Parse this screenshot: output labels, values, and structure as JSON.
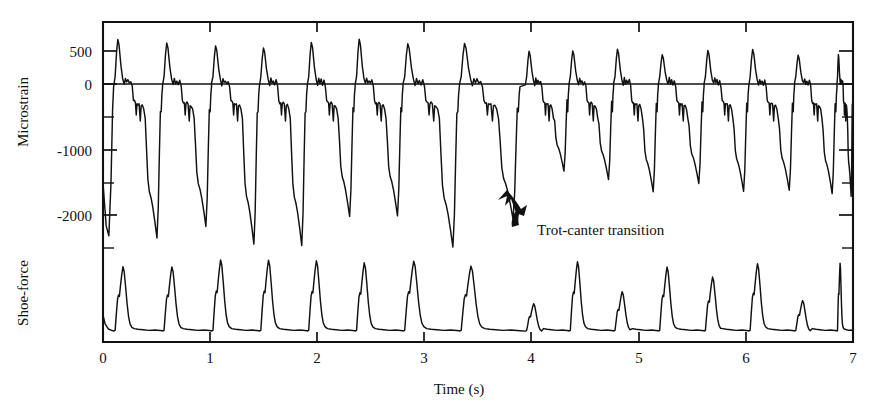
{
  "chart_data": {
    "type": "line",
    "title": "",
    "xlabel": "Time (s)",
    "ylabel": "Microstrain",
    "ylabel_secondary": "Shoe-force",
    "xlim": [
      0,
      7.05
    ],
    "ylim": [
      -2750,
      780
    ],
    "grid": false,
    "legend": null,
    "x_ticks": [
      0,
      1,
      2,
      3,
      4,
      5,
      6,
      7
    ],
    "x_tick_labels": [
      "0",
      "1",
      "2",
      "3",
      "4",
      "5",
      "6",
      "7"
    ],
    "y_ticks_labeled": [
      500,
      0,
      -1000,
      -2000
    ],
    "y_tick_labels": [
      "500",
      "0",
      "-1000",
      "-2000"
    ],
    "y_ticks_minor": [
      -500,
      -1500,
      -2500
    ],
    "annotations": [
      {
        "text": "Trot-canter transition",
        "x": 3.95,
        "y": -2050,
        "arrow": "curved-up-left"
      }
    ],
    "series": [
      {
        "name": "Microstrain",
        "units": "microstrain",
        "stride_period_trot": 0.46,
        "stride_period_canter": 0.43,
        "transition_time": 3.92,
        "trot_peak_max": 620,
        "trot_trough_min": -2330,
        "canter_peak_max": 490,
        "canter_trough_min": -1560,
        "description": "Bone strain gauge trace; each stride shows a positive tension peak followed by a deep compression trough. Amplitude drops markedly after the trot-canter transition."
      },
      {
        "name": "Shoe-force",
        "units": "arbitrary",
        "baseline_value": 0,
        "trot_peak_height": 1.0,
        "canter_peak_height_alternating": [
          0.45,
          0.95,
          0.55,
          1.0,
          0.75,
          0.95
        ],
        "description": "Ground reaction force at the shoe; sharp asymmetric peaks, one per stride, with a small notch on the rising limb. Peak heights alternate after the canter transition."
      }
    ],
    "trot_stride_times": [
      0.1,
      0.56,
      1.02,
      1.47,
      1.92,
      2.37,
      2.82,
      3.35
    ],
    "canter_stride_times": [
      3.97,
      4.38,
      4.8,
      5.22,
      5.65,
      6.07,
      6.5,
      6.9
    ]
  },
  "axes": {
    "y_label": "Microstrain",
    "y_label_secondary": "Shoe-force",
    "x_label": "Time (s)"
  }
}
